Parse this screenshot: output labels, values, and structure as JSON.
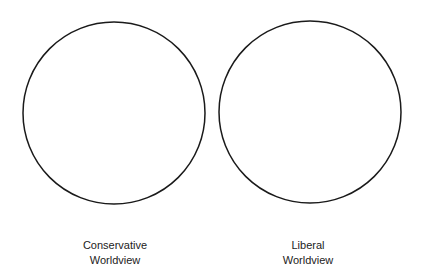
{
  "diagram": {
    "type": "two-circles",
    "stroke_color": "#1a1a1a",
    "circles": [
      {
        "id": "conservative",
        "label_line1": "Conservative",
        "label_line2": "Worldview"
      },
      {
        "id": "liberal",
        "label_line1": "Liberal",
        "label_line2": "Worldview"
      }
    ]
  }
}
